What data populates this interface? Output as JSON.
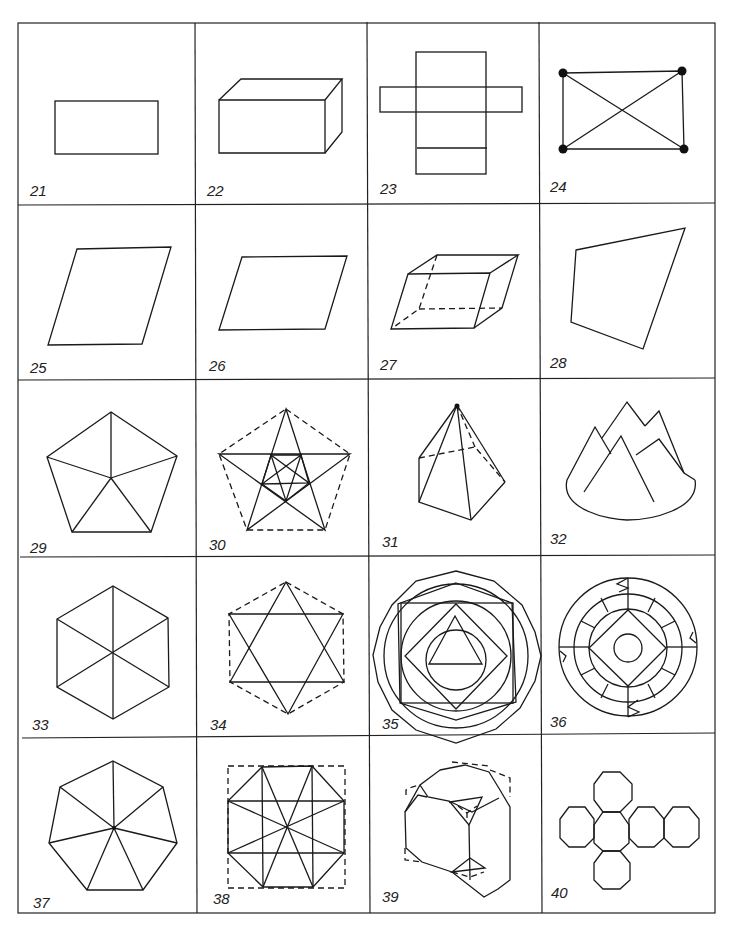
{
  "figure": {
    "columns": 4,
    "rows": 5,
    "cells": [
      {
        "number": "21",
        "shape": "rectangle"
      },
      {
        "number": "22",
        "shape": "rectangular-box"
      },
      {
        "number": "23",
        "shape": "box-net"
      },
      {
        "number": "24",
        "shape": "rectangle-with-diagonals-and-vertex-dots"
      },
      {
        "number": "25",
        "shape": "rhombus"
      },
      {
        "number": "26",
        "shape": "parallelogram"
      },
      {
        "number": "27",
        "shape": "parallelepiped-hidden-edges"
      },
      {
        "number": "28",
        "shape": "irregular-quadrilateral"
      },
      {
        "number": "29",
        "shape": "pentagon-triangulated-from-center"
      },
      {
        "number": "30",
        "shape": "nested-pentagram"
      },
      {
        "number": "31",
        "shape": "pentagonal-pyramid"
      },
      {
        "number": "32",
        "shape": "mountain-peaks"
      },
      {
        "number": "33",
        "shape": "hexagon-triangulated-from-center"
      },
      {
        "number": "34",
        "shape": "hexagram-in-dashed-hexagon"
      },
      {
        "number": "35",
        "shape": "nested-polygons-and-circles"
      },
      {
        "number": "36",
        "shape": "concentric-rings-with-square"
      },
      {
        "number": "37",
        "shape": "heptagon-triangulated-from-center"
      },
      {
        "number": "38",
        "shape": "octagon-with-diagonals-in-dashed-square"
      },
      {
        "number": "39",
        "shape": "truncated-cube"
      },
      {
        "number": "40",
        "shape": "octagon-net-cross"
      }
    ]
  }
}
